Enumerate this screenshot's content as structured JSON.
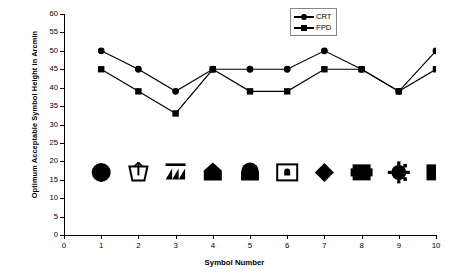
{
  "chart_data": {
    "type": "line",
    "title": "",
    "xlabel": "Symbol Number",
    "ylabel": "Optimum Acceptable Symbol Height in Arcmin",
    "x": [
      1,
      2,
      3,
      4,
      5,
      6,
      7,
      8,
      9,
      10
    ],
    "categories": [
      "1",
      "2",
      "3",
      "4",
      "5",
      "6",
      "7",
      "8",
      "9",
      "10"
    ],
    "series": [
      {
        "name": "CRT",
        "marker": "circle",
        "values": [
          50,
          45,
          39,
          45,
          45,
          45,
          50,
          45,
          39,
          50
        ]
      },
      {
        "name": "FPD",
        "marker": "square",
        "values": [
          45,
          39,
          33,
          45,
          39,
          39,
          45,
          45,
          39,
          45
        ]
      }
    ],
    "xlim": [
      0,
      10
    ],
    "ylim": [
      0,
      60
    ],
    "yticks": [
      0,
      5,
      10,
      15,
      20,
      25,
      30,
      35,
      40,
      45,
      50,
      55,
      60
    ],
    "xticks": [
      0,
      1,
      2,
      3,
      4,
      5,
      6,
      7,
      8,
      9,
      10
    ],
    "grid": false,
    "legend_position": "top-right",
    "line_color": "#000000",
    "symbol_row_y": 17,
    "symbol_icons": [
      "filled-circle-symbol",
      "basket-with-arrow-symbol",
      "triangles-under-bar-symbol",
      "pentagon-house-symbol",
      "dome-symbol",
      "framed-box-symbol",
      "diamond-symbol",
      "notched-square-symbol",
      "spoked-circle-symbol",
      "notched-rectangle-symbol"
    ]
  },
  "axes": {
    "y_title": "Optimum Acceptable Symbol Height in Arcmin",
    "x_title": "Symbol Number",
    "y_tick_labels": [
      "0",
      "5",
      "10",
      "15",
      "20",
      "25",
      "30",
      "35",
      "40",
      "45",
      "50",
      "55",
      "60"
    ],
    "x_tick_labels": [
      "0",
      "1",
      "2",
      "3",
      "4",
      "5",
      "6",
      "7",
      "8",
      "9",
      "10"
    ]
  },
  "legend": {
    "entries": [
      {
        "label": "CRT",
        "marker": "circle"
      },
      {
        "label": "FPD",
        "marker": "square"
      }
    ]
  }
}
